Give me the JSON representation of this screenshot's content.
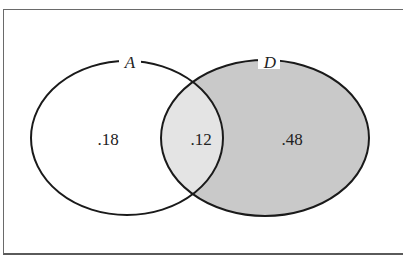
{
  "diagram": {
    "type": "venn",
    "sets": [
      {
        "id": "A",
        "label": "A"
      },
      {
        "id": "D",
        "label": "D"
      }
    ],
    "regions": {
      "a_only": ".18",
      "intersection": ".12",
      "d_only": ".48"
    },
    "colors": {
      "stroke": "#1a1a1a",
      "a_only_fill": "#ffffff",
      "intersection_fill": "#e4e4e4",
      "d_only_fill": "#c9c9c9",
      "frame": "#6a6a6a"
    }
  }
}
